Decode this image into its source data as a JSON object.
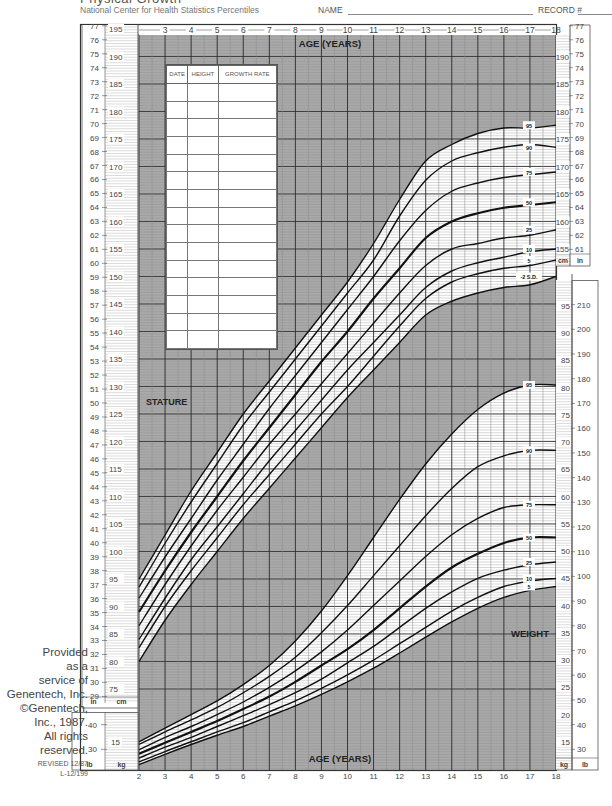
{
  "header": {
    "title": "Physical Growth",
    "subtitle": "National Center for Health Statistics Percentiles",
    "name_label": "NAME",
    "record_label": "RECORD #"
  },
  "record_table": {
    "columns": [
      "DATE",
      "HEIGHT",
      "GROWTH RATE"
    ],
    "row_count": 15
  },
  "credit": {
    "lines": [
      "Provided",
      "as a",
      "service of",
      "Genentech, Inc.",
      "©Genentech,",
      "Inc., 1987.",
      "All rights",
      "reserved."
    ],
    "revised": "REVISED 12/87",
    "code": "L-12/199"
  },
  "colors": {
    "shade": "#a9a9a9",
    "grid_minor": "#8a8a8a",
    "grid_major": "#2a2a2a",
    "curve": "#111111",
    "paper": "#ffffff",
    "text": "#444444"
  },
  "chart_data": [
    {
      "type": "line",
      "title": "STATURE",
      "xlabel": "AGE (YEARS)",
      "ylabel_left": "in / cm",
      "ylabel_right": "cm / in",
      "x_ticks": [
        2,
        3,
        4,
        5,
        6,
        7,
        8,
        9,
        10,
        11,
        12,
        13,
        14,
        15,
        16,
        17,
        18
      ],
      "top_x_ticks": [
        3,
        4,
        5,
        6,
        7,
        8,
        9,
        10,
        11,
        12,
        13,
        14,
        15,
        16,
        17,
        18
      ],
      "xlim": [
        2,
        18
      ],
      "ylim_cm": [
        74,
        196
      ],
      "left_cm_ticks": [
        75,
        80,
        85,
        90,
        95,
        100,
        105,
        110,
        115,
        120,
        125,
        130,
        135,
        140,
        145,
        150,
        155,
        160,
        165,
        170,
        175,
        180,
        185,
        190,
        195
      ],
      "left_in_ticks": [
        29,
        30,
        31,
        32,
        33,
        34,
        35,
        36,
        37,
        38,
        39,
        40,
        41,
        42,
        43,
        44,
        45,
        46,
        47,
        48,
        49,
        50,
        51,
        52,
        53,
        54,
        55,
        56,
        57,
        58,
        59,
        60,
        61,
        62,
        63,
        64,
        65,
        66,
        67,
        68,
        69,
        70,
        71,
        72,
        73,
        74,
        75,
        76,
        77
      ],
      "right_cm_ticks": [
        155,
        160,
        165,
        170,
        175,
        180,
        185,
        190
      ],
      "right_in_ticks": [
        61,
        62,
        63,
        64,
        65,
        66,
        67,
        68,
        69,
        70,
        71,
        72,
        73,
        74,
        75,
        76,
        77
      ],
      "left_units": {
        "in": "in",
        "cm": "cm"
      },
      "right_units": {
        "cm": "cm",
        "in": "in"
      },
      "grid": true,
      "series": [
        {
          "name": "95",
          "x": [
            2,
            3,
            4,
            5,
            6,
            7,
            8,
            9,
            10,
            11,
            12,
            13,
            14,
            15,
            16,
            17,
            18
          ],
          "values": [
            95,
            103,
            111,
            118,
            125,
            131,
            137,
            143,
            149,
            156,
            164,
            171,
            174,
            176,
            177,
            177,
            177.5
          ]
        },
        {
          "name": "90",
          "x": [
            2,
            3,
            4,
            5,
            6,
            7,
            8,
            9,
            10,
            11,
            12,
            13,
            14,
            15,
            16,
            17,
            18
          ],
          "values": [
            93.5,
            101.5,
            109,
            116,
            123,
            129,
            135,
            141,
            147,
            153,
            161,
            167.5,
            171,
            172.5,
            173.5,
            174,
            173.5
          ]
        },
        {
          "name": "75",
          "x": [
            2,
            3,
            4,
            5,
            6,
            7,
            8,
            9,
            10,
            11,
            12,
            13,
            14,
            15,
            16,
            17,
            18
          ],
          "values": [
            91.5,
            99,
            106,
            113,
            119.5,
            126,
            132,
            138,
            144,
            150,
            156.5,
            162,
            165.5,
            167,
            168,
            168.5,
            169
          ]
        },
        {
          "name": "50",
          "x": [
            2,
            3,
            4,
            5,
            6,
            7,
            8,
            9,
            10,
            11,
            12,
            13,
            14,
            15,
            16,
            17,
            18
          ],
          "values": [
            89,
            96.5,
            103.5,
            110,
            116.5,
            122.5,
            128.5,
            134.5,
            140,
            146,
            151.5,
            157,
            160,
            161.5,
            162.5,
            163,
            163.5
          ]
        },
        {
          "name": "25",
          "x": [
            2,
            3,
            4,
            5,
            6,
            7,
            8,
            9,
            10,
            11,
            12,
            13,
            14,
            15,
            16,
            17,
            18
          ],
          "values": [
            86.5,
            94,
            101,
            107.5,
            113.5,
            119.5,
            125,
            130.5,
            136,
            141.5,
            147,
            152,
            155,
            156,
            157,
            157.5,
            158.5
          ]
        },
        {
          "name": "10",
          "x": [
            2,
            3,
            4,
            5,
            6,
            7,
            8,
            9,
            10,
            11,
            12,
            13,
            14,
            15,
            16,
            17,
            18
          ],
          "values": [
            84,
            91.5,
            98.5,
            104.5,
            110.5,
            116.5,
            122,
            127.5,
            133,
            138,
            143,
            148,
            151,
            152.5,
            153.5,
            154.5,
            155
          ]
        },
        {
          "name": "5",
          "x": [
            2,
            3,
            4,
            5,
            6,
            7,
            8,
            9,
            10,
            11,
            12,
            13,
            14,
            15,
            16,
            17,
            18
          ],
          "values": [
            82.5,
            90,
            96.5,
            102.5,
            108.5,
            114,
            119.5,
            125,
            130,
            135.5,
            141,
            146,
            149,
            150.5,
            151.5,
            152,
            153
          ]
        },
        {
          "name": "-2 S.D.",
          "x": [
            2,
            3,
            4,
            5,
            6,
            7,
            8,
            9,
            10,
            11,
            12,
            13,
            14,
            15,
            16,
            17,
            18
          ],
          "values": [
            80,
            87.5,
            94,
            100,
            106,
            111.5,
            117,
            122.5,
            128,
            133,
            138,
            143,
            145.5,
            147,
            148,
            148.5,
            150
          ]
        }
      ]
    },
    {
      "type": "line",
      "title": "WEIGHT",
      "xlabel": "AGE (YEARS)",
      "ylabel_left": "lb / kg",
      "ylabel_right": "kg / lb",
      "x_ticks": [
        2,
        3,
        4,
        5,
        6,
        7,
        8,
        9,
        10,
        11,
        12,
        13,
        14,
        15,
        16,
        17,
        18
      ],
      "xlim": [
        2,
        18
      ],
      "ylim_kg": [
        10,
        97
      ],
      "left_kg_ticks": [
        15
      ],
      "left_lb_ticks": [
        30,
        40
      ],
      "right_kg_ticks": [
        15,
        20,
        25,
        30,
        35,
        40,
        45,
        50,
        55,
        60,
        65,
        70,
        75,
        80,
        85,
        90,
        95
      ],
      "right_lb_ticks": [
        30,
        40,
        50,
        60,
        70,
        80,
        90,
        100,
        110,
        120,
        130,
        140,
        150,
        160,
        170,
        180,
        190,
        200,
        210
      ],
      "left_units": {
        "lb": "lb",
        "kg": "kg"
      },
      "right_units": {
        "kg": "kg",
        "lb": "lb"
      },
      "grid": true,
      "series": [
        {
          "name": "95",
          "x": [
            2,
            3,
            4,
            5,
            6,
            7,
            8,
            9,
            10,
            11,
            12,
            13,
            14,
            15,
            16,
            17,
            18
          ],
          "values": [
            15,
            17.5,
            20,
            22.5,
            25.5,
            29,
            33.5,
            39,
            45.5,
            52.5,
            59.5,
            66,
            71.5,
            76,
            79,
            80.5,
            80.5
          ]
        },
        {
          "name": "90",
          "x": [
            2,
            3,
            4,
            5,
            6,
            7,
            8,
            9,
            10,
            11,
            12,
            13,
            14,
            15,
            16,
            17,
            18
          ],
          "values": [
            14.5,
            16.8,
            19,
            21.3,
            24,
            27,
            30.5,
            35,
            40,
            45.5,
            51,
            56.5,
            61.5,
            65.5,
            67.5,
            68.5,
            68.5
          ]
        },
        {
          "name": "75",
          "x": [
            2,
            3,
            4,
            5,
            6,
            7,
            8,
            9,
            10,
            11,
            12,
            13,
            14,
            15,
            16,
            17,
            18
          ],
          "values": [
            13.5,
            15.8,
            17.8,
            20,
            22.3,
            25,
            28,
            31.5,
            35.5,
            40,
            44.5,
            49,
            53,
            56,
            58,
            58.5,
            58.5
          ]
        },
        {
          "name": "50",
          "x": [
            2,
            3,
            4,
            5,
            6,
            7,
            8,
            9,
            10,
            11,
            12,
            13,
            14,
            15,
            16,
            17,
            18
          ],
          "values": [
            12.8,
            14.8,
            16.8,
            18.8,
            21,
            23.3,
            26,
            29,
            32,
            35.5,
            39.5,
            43.5,
            47,
            49.5,
            51.5,
            52.5,
            52.5
          ]
        },
        {
          "name": "25",
          "x": [
            2,
            3,
            4,
            5,
            6,
            7,
            8,
            9,
            10,
            11,
            12,
            13,
            14,
            15,
            16,
            17,
            18
          ],
          "values": [
            12,
            14,
            15.8,
            17.8,
            19.8,
            21.8,
            24,
            26.5,
            29.5,
            32.5,
            36,
            39.5,
            42.5,
            45,
            46.5,
            47.5,
            48
          ]
        },
        {
          "name": "10",
          "x": [
            2,
            3,
            4,
            5,
            6,
            7,
            8,
            9,
            10,
            11,
            12,
            13,
            14,
            15,
            16,
            17,
            18
          ],
          "values": [
            11.3,
            13.2,
            15,
            16.8,
            18.5,
            20.5,
            22.5,
            24.8,
            27.3,
            30,
            33,
            36,
            39,
            41.5,
            43.5,
            44.5,
            45
          ]
        },
        {
          "name": "5",
          "x": [
            2,
            3,
            4,
            5,
            6,
            7,
            8,
            9,
            10,
            11,
            12,
            13,
            14,
            15,
            16,
            17,
            18
          ],
          "values": [
            10.8,
            12.7,
            14.5,
            16.2,
            17.8,
            19.7,
            21.6,
            23.7,
            26,
            28.5,
            31.3,
            34.2,
            37,
            39.5,
            41.5,
            42.8,
            43.5
          ]
        }
      ]
    }
  ],
  "labels": {
    "age_top": "AGE (YEARS)",
    "age_bottom": "AGE (YEARS)",
    "stature": "STATURE",
    "weight": "WEIGHT"
  }
}
